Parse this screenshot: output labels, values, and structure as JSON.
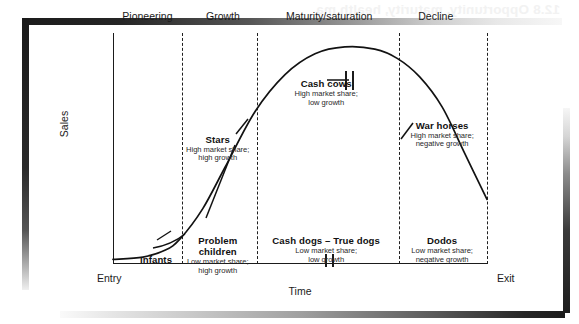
{
  "page": {
    "bleed_text": "12.8  Opportunity, maturity, health ma"
  },
  "chart_data": {
    "type": "line",
    "title": "",
    "xlabel": "Time",
    "ylabel": "Sales",
    "x_axis_start_label": "Entry",
    "x_axis_end_label": "Exit",
    "grid": false,
    "legend": "none",
    "stages": [
      {
        "label": "Pioneering",
        "center_pct": 9.2
      },
      {
        "label": "Growth",
        "center_pct": 29.4
      },
      {
        "label": "Maturity/saturation",
        "center_pct": 57.8
      },
      {
        "label": "Decline",
        "center_pct": 86.3
      }
    ],
    "stage_boundaries_pct": [
      18.4,
      38.5,
      76.5,
      100
    ],
    "series": [
      {
        "name": "Sales over product life cycle",
        "x": [
          0,
          8,
          14,
          18,
          24,
          30,
          38,
          46,
          54,
          62,
          70,
          76,
          82,
          88,
          94,
          100
        ],
        "y": [
          2,
          3,
          6,
          11,
          24,
          42,
          66,
          82,
          91,
          94,
          93,
          89,
          81,
          68,
          48,
          28
        ]
      }
    ],
    "annotations": [
      {
        "id": "cash-cows",
        "title": "Cash cows",
        "subtitle_lines": [
          "High market share;",
          "low growth"
        ],
        "x_pct": 57.0,
        "y_pct": 80.0
      },
      {
        "id": "stars",
        "title": "Stars",
        "subtitle_lines": [
          "High market share;",
          "high growth"
        ],
        "x_pct": 28.0,
        "y_pct": 56.0
      },
      {
        "id": "war-horses",
        "title": "War horses",
        "subtitle_lines": [
          "High market share;",
          "negative growth"
        ],
        "x_pct": 88.0,
        "y_pct": 62.0
      },
      {
        "id": "problem-children",
        "title": "Problem children",
        "subtitle_lines": [
          "Low market share;",
          "high growth"
        ],
        "x_pct": 28.0,
        "y_pct": 12.0
      },
      {
        "id": "cash-dogs-true-dogs",
        "title": "Cash dogs – True dogs",
        "subtitle_lines": [
          "Low market share;",
          "low growth"
        ],
        "x_pct": 57.0,
        "y_pct": 12.0
      },
      {
        "id": "dodos",
        "title": "Dodos",
        "subtitle_lines": [
          "Low market share;",
          "negative growth"
        ],
        "x_pct": 88.0,
        "y_pct": 12.0
      },
      {
        "id": "infants",
        "title": "Infants",
        "subtitle_lines": [],
        "x_pct": 11.5,
        "y_pct": 4.0
      }
    ]
  }
}
